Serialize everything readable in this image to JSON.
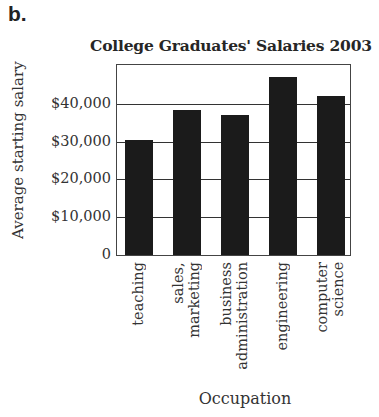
{
  "figure_label": "b.",
  "chart_data": {
    "type": "bar",
    "title": "College Graduates' Salaries 2003",
    "xlabel": "Occupation",
    "ylabel": "Average starting salary",
    "categories": [
      "teaching",
      "sales, marketing",
      "business administration",
      "engineering",
      "computer science"
    ],
    "category_lines": [
      [
        "teaching"
      ],
      [
        "sales,",
        "marketing"
      ],
      [
        "business",
        "administration"
      ],
      [
        "engineering"
      ],
      [
        "computer",
        "science"
      ]
    ],
    "values": [
      30300,
      38400,
      37100,
      47000,
      42000
    ],
    "ylim": [
      0,
      50000
    ],
    "yticks": [
      0,
      10000,
      20000,
      30000,
      40000
    ],
    "ytick_labels": [
      "0",
      "$10,000",
      "$20,000",
      "$30,000",
      "$40,000"
    ],
    "grid": true,
    "bar_color": "#1b1b1b",
    "legend": null
  }
}
